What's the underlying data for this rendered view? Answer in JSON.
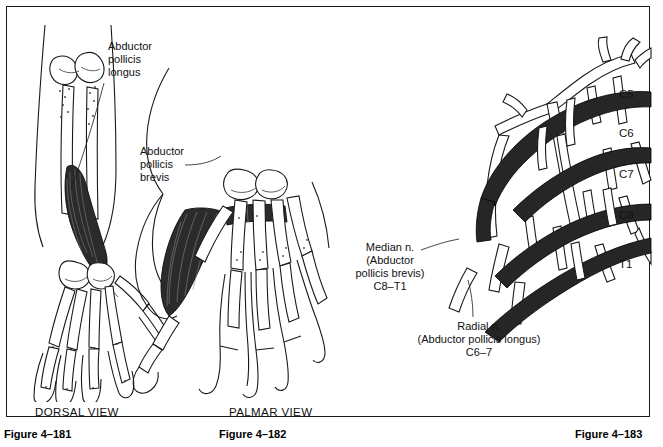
{
  "plate": {
    "labels": {
      "abductor_pollicis_longus": "Abductor\npollicis\nlongus",
      "abductor_pollicis_brevis": "Abductor\npollicis\nbrevis",
      "median_nerve": "Median n.\n(Abductor\npollicis brevis)\nC8–T1",
      "radial_nerve": "Radial n.\n(Abductor pollicis longus)\nC6–7"
    },
    "view_captions": {
      "dorsal": "DORSAL VIEW",
      "palmar": "PALMAR VIEW"
    },
    "spinal_roots": [
      {
        "label": "C5",
        "top": 81
      },
      {
        "label": "C6",
        "top": 120
      },
      {
        "label": "C7",
        "top": 161
      },
      {
        "label": "C8",
        "top": 202
      },
      {
        "label": "T1",
        "top": 251
      }
    ]
  },
  "figure_numbers": {
    "dorsal": "Figure 4–181",
    "palmar": "Figure 4–182",
    "plexus": "Figure 4–183"
  },
  "colors": {
    "ink": "#1a1a1a",
    "muscle_fill": "#2b2b2b",
    "nerve_highlight": "#262626",
    "page": "#ffffff"
  }
}
